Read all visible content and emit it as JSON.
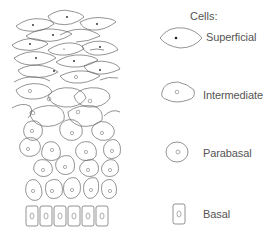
{
  "diagram": {
    "title": "Cells:",
    "legend": [
      {
        "label": "Superficial",
        "icon": "superficial-cell-icon"
      },
      {
        "label": "Intermediate",
        "icon": "intermediate-cell-icon"
      },
      {
        "label": "Parabasal",
        "icon": "parabasal-cell-icon"
      },
      {
        "label": "Basal",
        "icon": "basal-cell-icon"
      }
    ],
    "layers": [
      "superficial",
      "intermediate",
      "parabasal",
      "basal"
    ],
    "colors": {
      "stroke": "#666666",
      "text": "#555555",
      "background": "#ffffff"
    }
  }
}
